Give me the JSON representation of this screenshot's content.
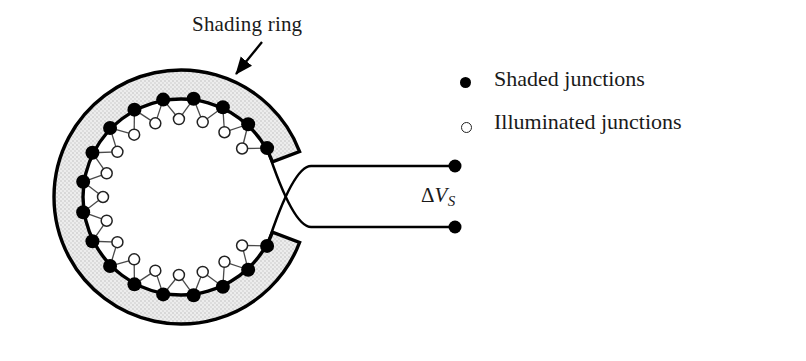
{
  "figure": {
    "kind": "thermopile-shading-ring-diagram",
    "width": 806,
    "height": 361,
    "background": "#ffffff"
  },
  "annotations": {
    "shading_ring_label": "Shading ring",
    "voltage_symbol_delta": "Δ",
    "voltage_symbol_var": "V",
    "voltage_symbol_sub": "S"
  },
  "legend": {
    "items": [
      {
        "marker": "filled-dot-icon",
        "label": "Shaded junctions"
      },
      {
        "marker": "open-circle-icon",
        "label": "Illuminated junctions"
      }
    ]
  },
  "geometry": {
    "center_x": 181,
    "center_y": 197,
    "ring_outer_radius": 127,
    "ring_inner_radius": 98,
    "gap_start_deg": -21,
    "gap_end_deg": 21,
    "shaded_junction_radius": 99,
    "illuminated_junction_radius": 78,
    "shaded_dot_radius": 7,
    "illuminated_dot_radius": 5.5,
    "junction_pair_count": 18,
    "ring_stroke_width": 3.4,
    "wire_stroke_width": 1.3,
    "terminal_x": 455,
    "terminal_top_y": 166,
    "terminal_bottom_y": 227,
    "terminal_dot_radius": 6.5,
    "arrow_tail_x": 262,
    "arrow_tail_y": 42,
    "arrow_head_x": 236,
    "arrow_head_y": 74
  },
  "colors": {
    "ink": "#000000",
    "ring_fill": "#e9e9e9",
    "wire": "#4a4a4a",
    "open_marker_stroke": "#222222",
    "paper": "#ffffff"
  }
}
